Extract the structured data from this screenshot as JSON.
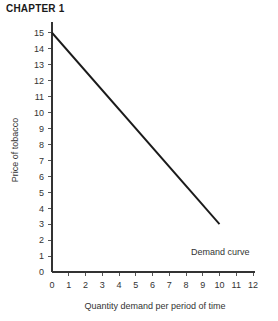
{
  "page": {
    "chapter_heading": "CHAPTER 1",
    "background_color": "#ffffff",
    "ink_color": "#1a1a1a"
  },
  "chart_data": {
    "type": "line",
    "title": "",
    "xlabel": "Quantity demand per period of time",
    "ylabel": "Price of tobacco",
    "xlim": [
      0,
      12
    ],
    "ylim": [
      0,
      15
    ],
    "xticks": [
      0,
      1,
      2,
      3,
      4,
      5,
      6,
      7,
      8,
      9,
      10,
      11,
      12
    ],
    "yticks": [
      0,
      1,
      2,
      3,
      4,
      5,
      6,
      7,
      8,
      9,
      10,
      11,
      12,
      13,
      14,
      15
    ],
    "xticklabels": [
      "0",
      "1",
      "2",
      "3",
      "4",
      "5",
      "6",
      "7",
      "8",
      "9",
      "10",
      "11",
      "12"
    ],
    "yticklabels": [
      "0",
      "1",
      "2",
      "3",
      "4",
      "5",
      "6",
      "7",
      "8",
      "9",
      "10",
      "11",
      "12",
      "13",
      "14",
      "15"
    ],
    "grid": false,
    "legend": false,
    "series": [
      {
        "name": "Demand curve",
        "color": "#1a1a1a",
        "x": [
          0,
          10
        ],
        "y": [
          15,
          3
        ]
      }
    ],
    "annotations": [
      {
        "text": "Demand curve",
        "x": 8.3,
        "y": 1.05
      }
    ]
  }
}
